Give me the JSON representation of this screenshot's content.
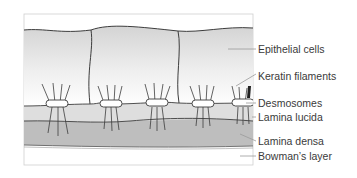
{
  "figure": {
    "colors": {
      "frame": "#c8c8c8",
      "cell_fill_top": "#d6d6d6",
      "cell_fill_bottom": "#ffffff",
      "outline": "#3c3c3c",
      "lamina_lucida": "#dcdcdc",
      "lamina_densa": "#bdbdbd",
      "bowmans_layer": "#ffffff",
      "desmosome": "#ffffff",
      "leader_line": "#9a9a9a",
      "label_text": "#3a3a3a"
    },
    "labels": [
      {
        "id": "epithelial-cells",
        "text": "Epithelial cells",
        "y": 43
      },
      {
        "id": "keratin-filaments",
        "text": "Keratin filaments",
        "y": 70
      },
      {
        "id": "desmosomes",
        "text": "Desmosomes",
        "y": 97
      },
      {
        "id": "lamina-lucida",
        "text": "Lamina lucida",
        "y": 111
      },
      {
        "id": "lamina-densa",
        "text": "Lamina densa",
        "y": 135
      },
      {
        "id": "bowmans-layer",
        "text": "Bowman’s layer",
        "y": 150
      }
    ]
  }
}
